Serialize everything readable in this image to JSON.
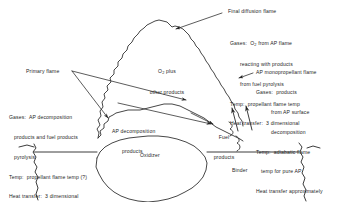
{
  "figure": {
    "title_implicit": "Combustion zone structure of an AP composite propellant",
    "labels": {
      "final_diffusion_flame": "Final diffusion flame",
      "primary_flame": "Primary flame",
      "ap_monopropellant_flame": "AP monopropellant flame",
      "o2_plus": "O",
      "o2_sub": "2",
      "o2_plus_tail": " plus",
      "other_products": "other products",
      "ap_decomposition": "AP decomposition",
      "ap_decomposition_products": "products",
      "fuel": "Fuel",
      "fuel_products": "products",
      "oxidizer": "Oxidizer",
      "binder": "Binder"
    },
    "callout_top_right": {
      "line1_pre": "Gases:  O",
      "line1_sub": "2",
      "line1_post": " from AP flame",
      "line2": "reacting with products",
      "line3": "from fuel pyrolysis",
      "line4": "Temp:  propellant flame temp",
      "line5": "Heat transfer:  3 dimensional"
    },
    "callout_right": {
      "line1": "Gases:  products",
      "line2": "from AP surface",
      "line3": "decomposition",
      "line4": "Temp:  adiabatic flame",
      "line5": "temp for pure AP",
      "line6": "Heat transfer approximately",
      "line7": "one-dimensional"
    },
    "callout_left": {
      "line1": "Gases:  AP decomposition",
      "line2": "products and fuel products",
      "line3": "pyrolysis",
      "line4": "Temp:  propellant flame temp (?)",
      "line5": "Heat transfer:  3 dimensional"
    },
    "colors": {
      "ink": "#262626",
      "background": "#ffffff"
    }
  }
}
